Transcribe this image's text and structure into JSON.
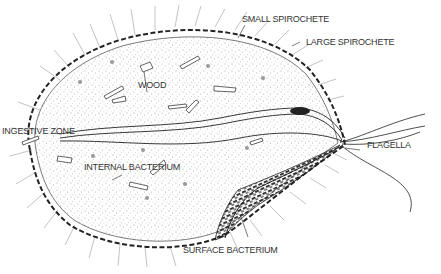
{
  "diagram": {
    "labels": {
      "small_spirochete": "SMALL SPIROCHETE",
      "large_spirochete": "LARGE SPIROCHETE",
      "wood": "WOOD",
      "ingestive_zone": "INGESTIVE ZONE",
      "internal_bacterium": "INTERNAL BACTERIUM",
      "flagella": "FLAGELLA",
      "surface_bacterium": "SURFACE BACTERIUM"
    },
    "colors": {
      "ink": "#222222",
      "stipple": "#555555",
      "hair": "#999999",
      "background": "#ffffff"
    }
  }
}
